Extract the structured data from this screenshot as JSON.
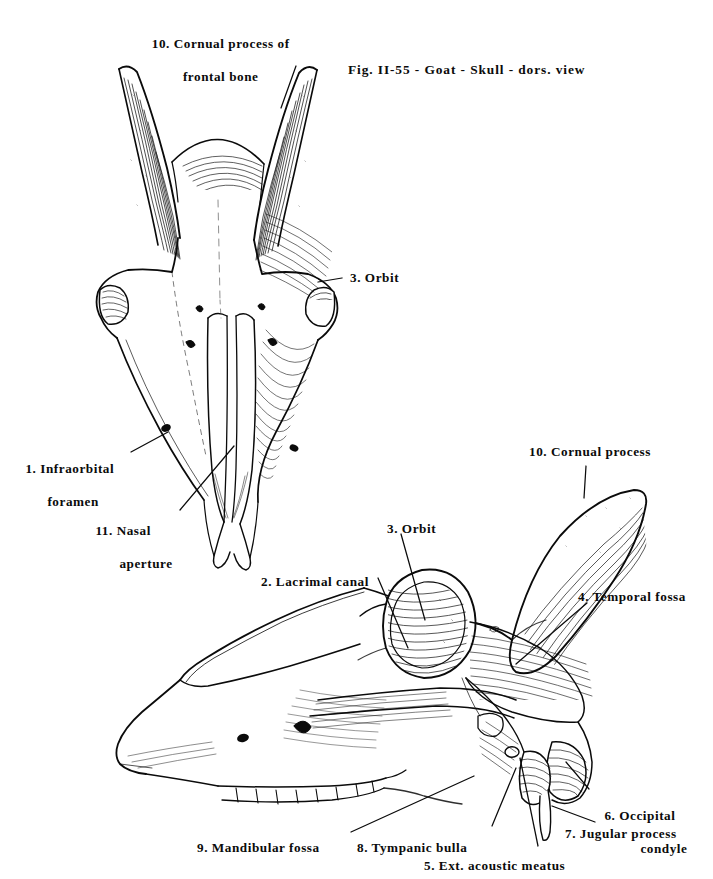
{
  "plate": {
    "caption": "Fig. II-55 - Goat - Skull - dors. view",
    "figure_number": "II-55",
    "species": "Goat",
    "specimen": "Skull"
  },
  "views": {
    "dorsal": {
      "name": "dorsal view"
    },
    "lateral": {
      "name": "lateral view"
    }
  },
  "labels": {
    "cornual_process_frontal_l1": "10. Cornual process of",
    "cornual_process_frontal_l2": "frontal bone",
    "orbit_dorsal": "3. Orbit",
    "infraorbital_l1": "1. Infraorbital",
    "infraorbital_l2": "foramen",
    "nasal_aperture_l1": "11. Nasal",
    "nasal_aperture_l2": "aperture",
    "cornual_process": "10. Cornual process",
    "orbit_lateral": "3. Orbit",
    "lacrimal_canal": "2. Lacrimal canal",
    "temporal_fossa": "4. Temporal fossa",
    "occipital_condyle_l1": "6. Occipital",
    "occipital_condyle_l2": "condyle",
    "jugular_process": "7. Jugular process",
    "mandibular_fossa": "9. Mandibular fossa",
    "tympanic_bulla": "8. Tympanic bulla",
    "ext_acoustic_meatus": "5. Ext. acoustic meatus"
  },
  "key": [
    {
      "number": "1",
      "term": "Infraorbital foramen"
    },
    {
      "number": "2",
      "term": "Lacrimal canal"
    },
    {
      "number": "3",
      "term": "Orbit"
    },
    {
      "number": "4",
      "term": "Temporal fossa"
    },
    {
      "number": "5",
      "term": "Ext. acoustic meatus"
    },
    {
      "number": "6",
      "term": "Occipital condyle"
    },
    {
      "number": "7",
      "term": "Jugular process"
    },
    {
      "number": "8",
      "term": "Tympanic bulla"
    },
    {
      "number": "9",
      "term": "Mandibular fossa"
    },
    {
      "number": "10",
      "term": "Cornual process of frontal bone"
    },
    {
      "number": "11",
      "term": "Nasal aperture"
    }
  ],
  "colors": {
    "ink": "#0b0b0b",
    "paper": "#ffffff",
    "hatch": "#161616"
  }
}
